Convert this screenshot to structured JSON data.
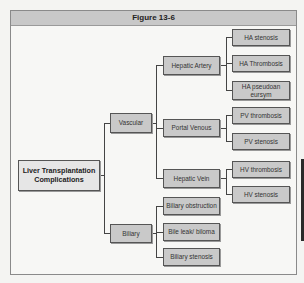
{
  "figure": {
    "title": "Figure 13-6"
  },
  "tree": {
    "root": "Liver Transplantation Complications",
    "vascular": {
      "label": "Vascular",
      "hepatic_artery": {
        "label": "Hepatic Artery",
        "children": [
          "HA stenosis",
          "HA Thrombosis",
          "HA pseudoaneursym"
        ]
      },
      "portal_venous": {
        "label": "Portal Venous",
        "children": [
          "PV thrombosis",
          "PV stenosis"
        ]
      },
      "hepatic_vein": {
        "label": "Hepatic Vein",
        "children": [
          "HV thrombosis",
          "HV stenosis"
        ]
      }
    },
    "biliary": {
      "label": "Biliary",
      "children": [
        "Biliary obstruction",
        "Bile leak/ biloma",
        "Biliary stenosis"
      ]
    }
  },
  "colors": {
    "box_fill": "#c9c9c9",
    "root_fill": "#e6e6e6",
    "header_fill": "#c8c8c8",
    "line": "#444444"
  }
}
